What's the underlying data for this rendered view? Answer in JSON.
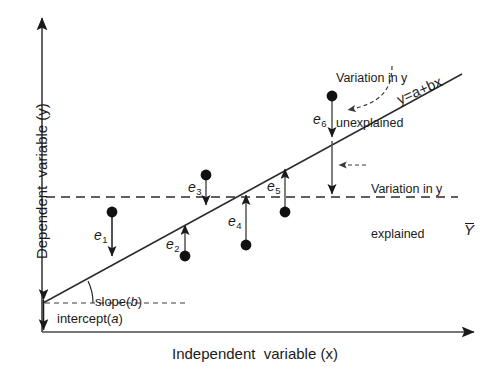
{
  "figure": {
    "axes": {
      "y_title": "Dependent  variable (y)",
      "x_title": "Independent  variable (x)"
    },
    "labels": {
      "regression_equation": "y=a+bx",
      "slope": "slope(b)",
      "intercept": "intercept(a)",
      "mean_y": "Y"
    },
    "annotations": [
      {
        "id": "unexplained",
        "line1": "Variation in y",
        "line2": "unexplained"
      },
      {
        "id": "explained",
        "line1": "Variation in y",
        "line2": "explained"
      }
    ],
    "residuals": [
      {
        "id": "e1",
        "label": "e",
        "sub": "1",
        "direction": "down",
        "point_x": 112,
        "point_y": 212,
        "line_y": 259
      },
      {
        "id": "e2",
        "label": "e",
        "sub": "2",
        "direction": "up",
        "point_x": 185,
        "point_y": 256,
        "line_y": 222
      },
      {
        "id": "e3",
        "label": "e",
        "sub": "3",
        "direction": "down",
        "point_x": 206,
        "point_y": 175,
        "line_y": 208
      },
      {
        "id": "e4",
        "label": "e",
        "sub": "4",
        "direction": "up",
        "point_x": 246,
        "point_y": 245,
        "line_y": 192
      },
      {
        "id": "e5",
        "label": "e",
        "sub": "5",
        "direction": "up",
        "point_x": 285,
        "point_y": 212,
        "line_y": 166
      },
      {
        "id": "e6",
        "label": "e",
        "sub": "6",
        "direction": "down",
        "point_x": 332,
        "point_y": 96,
        "line_y": 140
      }
    ],
    "colors": {
      "ink": "#1a1a1a",
      "line": "#2b2b2b",
      "dashed": "#3a3a3a",
      "arrow": "#4a4a4a",
      "background": "#ffffff"
    },
    "geometry": {
      "y_axis_x": 42,
      "y_axis_top": 14,
      "x_axis_y": 332,
      "x_axis_right": 478,
      "regression_start": [
        43,
        303
      ],
      "regression_end": [
        462,
        74
      ],
      "mean_line_y": 197,
      "mean_line_x_start": 46,
      "mean_line_x_end": 458,
      "intercept_dashed_y": 303
    }
  }
}
